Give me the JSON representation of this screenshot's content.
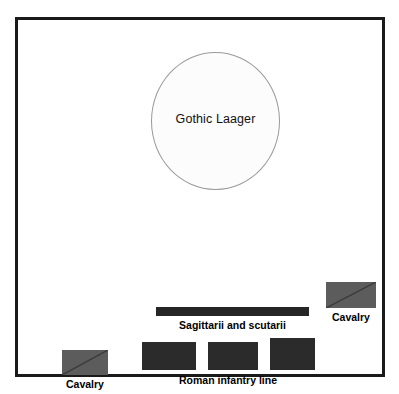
{
  "diagram": {
    "frame": {
      "border_color": "#1a1a1a"
    },
    "laager": {
      "label": "Gothic Laager",
      "fill": "#fcfcfc",
      "stroke": "#9a9a9a"
    },
    "skirmishers": {
      "label": "Sagittarii and scutarii",
      "color": "#262626"
    },
    "infantry": {
      "label": "Roman infantry line",
      "color": "#2b2b2b",
      "blocks": [
        {
          "name": "infantry-block-left"
        },
        {
          "name": "infantry-block-center"
        },
        {
          "name": "infantry-block-right"
        }
      ]
    },
    "cavalry": {
      "color": "#5c5c5c",
      "diagonal_color": "#3a3a3a",
      "units": [
        {
          "name": "cavalry-right-wing",
          "label": "Cavalry"
        },
        {
          "name": "cavalry-left-wing",
          "label": "Cavalry"
        }
      ]
    }
  }
}
